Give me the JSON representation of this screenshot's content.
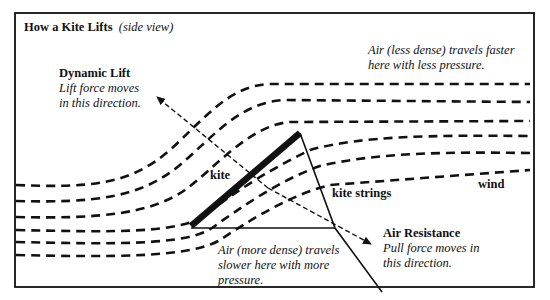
{
  "title": {
    "main": "How a Kite Lifts",
    "sub": "(side view)"
  },
  "labels": {
    "dynamic_lift": {
      "heading": "Dynamic Lift",
      "line1": "Lift force moves",
      "line2": "in this direction."
    },
    "upper_air": {
      "line1": "Air (less dense) travels faster",
      "line2": "here with less pressure."
    },
    "kite": "kite",
    "kite_strings": "kite strings",
    "wind": "wind",
    "lower_air": {
      "line1": "Air (more dense) travels",
      "line2": "slower here with more",
      "line3": "pressure."
    },
    "air_resistance": {
      "heading": "Air Resistance",
      "line1": "Pull force moves in",
      "line2": "this direction."
    }
  },
  "colors": {
    "ink": "#111111",
    "background": "#ffffff"
  }
}
